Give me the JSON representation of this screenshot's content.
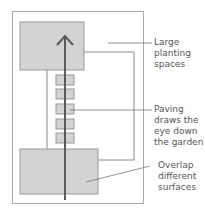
{
  "diagram": {
    "colors": {
      "fill": "#d3d3d3",
      "stroke": "#8a8a8a",
      "arrow": "#5a5a5a",
      "text": "#555555"
    },
    "labels": [
      {
        "id": "large-planting",
        "lines": [
          "Large",
          "planting",
          "spaces"
        ]
      },
      {
        "id": "paving",
        "lines": [
          "Paving",
          "draws the",
          "eye down",
          "the garden"
        ]
      },
      {
        "id": "overlap",
        "lines": [
          "Overlap",
          "different",
          "surfaces"
        ]
      }
    ],
    "paving_stones": 5
  }
}
